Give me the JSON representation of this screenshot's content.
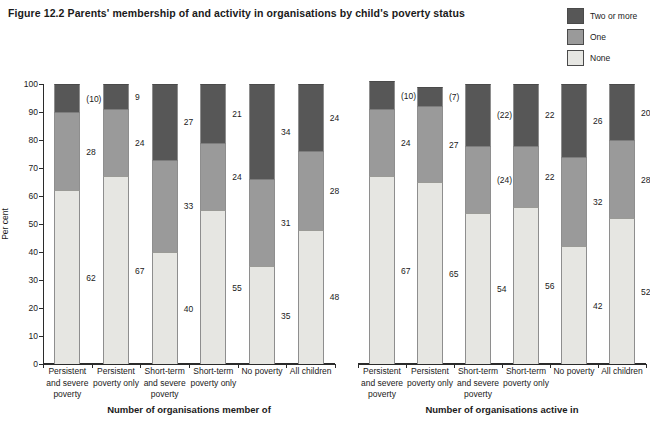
{
  "title": "Figure 12.2  Parents' membership of and activity in organisations by child's poverty status",
  "legend": {
    "position": "top-right",
    "items": [
      {
        "label": "Two or more",
        "color": "#575757",
        "key": "two_or_more"
      },
      {
        "label": "One",
        "color": "#9a9a9a",
        "key": "one"
      },
      {
        "label": "None",
        "color": "#e6e6e2",
        "key": "none"
      }
    ]
  },
  "axis": {
    "ylabel": "Per cent",
    "yticks": [
      "0",
      "10",
      "20",
      "30",
      "40",
      "50",
      "60",
      "70",
      "80",
      "90",
      "100"
    ],
    "ymin": 0,
    "ymax": 100
  },
  "chart_data": {
    "type": "bar",
    "subtype": "stacked-100-percent",
    "title": "Figure 12.2  Parents' membership of and activity in organisations by child's poverty status",
    "xlabel": "",
    "ylabel": "Per cent",
    "ylim": [
      0,
      100
    ],
    "grid": false,
    "legend_position": "top-right",
    "series_order": [
      "None",
      "One",
      "Two or more"
    ],
    "series_colors": {
      "None": "#e6e6e2",
      "One": "#9a9a9a",
      "Two or more": "#575757"
    },
    "panels": [
      {
        "name": "Number of organisations member of",
        "categories": [
          "Persistent and severe poverty",
          "Persistent poverty only",
          "Short-term and severe poverty",
          "Short-term poverty only",
          "No poverty",
          "All children"
        ],
        "series": [
          {
            "name": "None",
            "values": [
              62,
              67,
              40,
              55,
              35,
              48
            ],
            "labels": [
              "62",
              "67",
              "40",
              "55",
              "35",
              "48"
            ]
          },
          {
            "name": "One",
            "values": [
              28,
              24,
              33,
              24,
              31,
              28
            ],
            "labels": [
              "28",
              "24",
              "33",
              "24",
              "31",
              "28"
            ]
          },
          {
            "name": "Two or more",
            "values": [
              10,
              9,
              27,
              21,
              34,
              24
            ],
            "labels": [
              "(10)",
              "9",
              "27",
              "21",
              "34",
              "24"
            ]
          }
        ]
      },
      {
        "name": "Number of organisations active in",
        "categories": [
          "Persistent and severe poverty",
          "Persistent poverty only",
          "Short-term and severe poverty",
          "Short-term poverty only",
          "No poverty",
          "All children"
        ],
        "series": [
          {
            "name": "None",
            "values": [
              67,
              65,
              54,
              56,
              42,
              52
            ],
            "labels": [
              "67",
              "65",
              "54",
              "56",
              "42",
              "52"
            ]
          },
          {
            "name": "One",
            "values": [
              24,
              27,
              24,
              22,
              32,
              28
            ],
            "labels": [
              "24",
              "27",
              "(24)",
              "22",
              "32",
              "28"
            ]
          },
          {
            "name": "Two or more",
            "values": [
              10,
              7,
              22,
              22,
              26,
              20
            ],
            "labels": [
              "(10)",
              "(7)",
              "(22)",
              "22",
              "26",
              "20"
            ]
          }
        ]
      }
    ]
  }
}
